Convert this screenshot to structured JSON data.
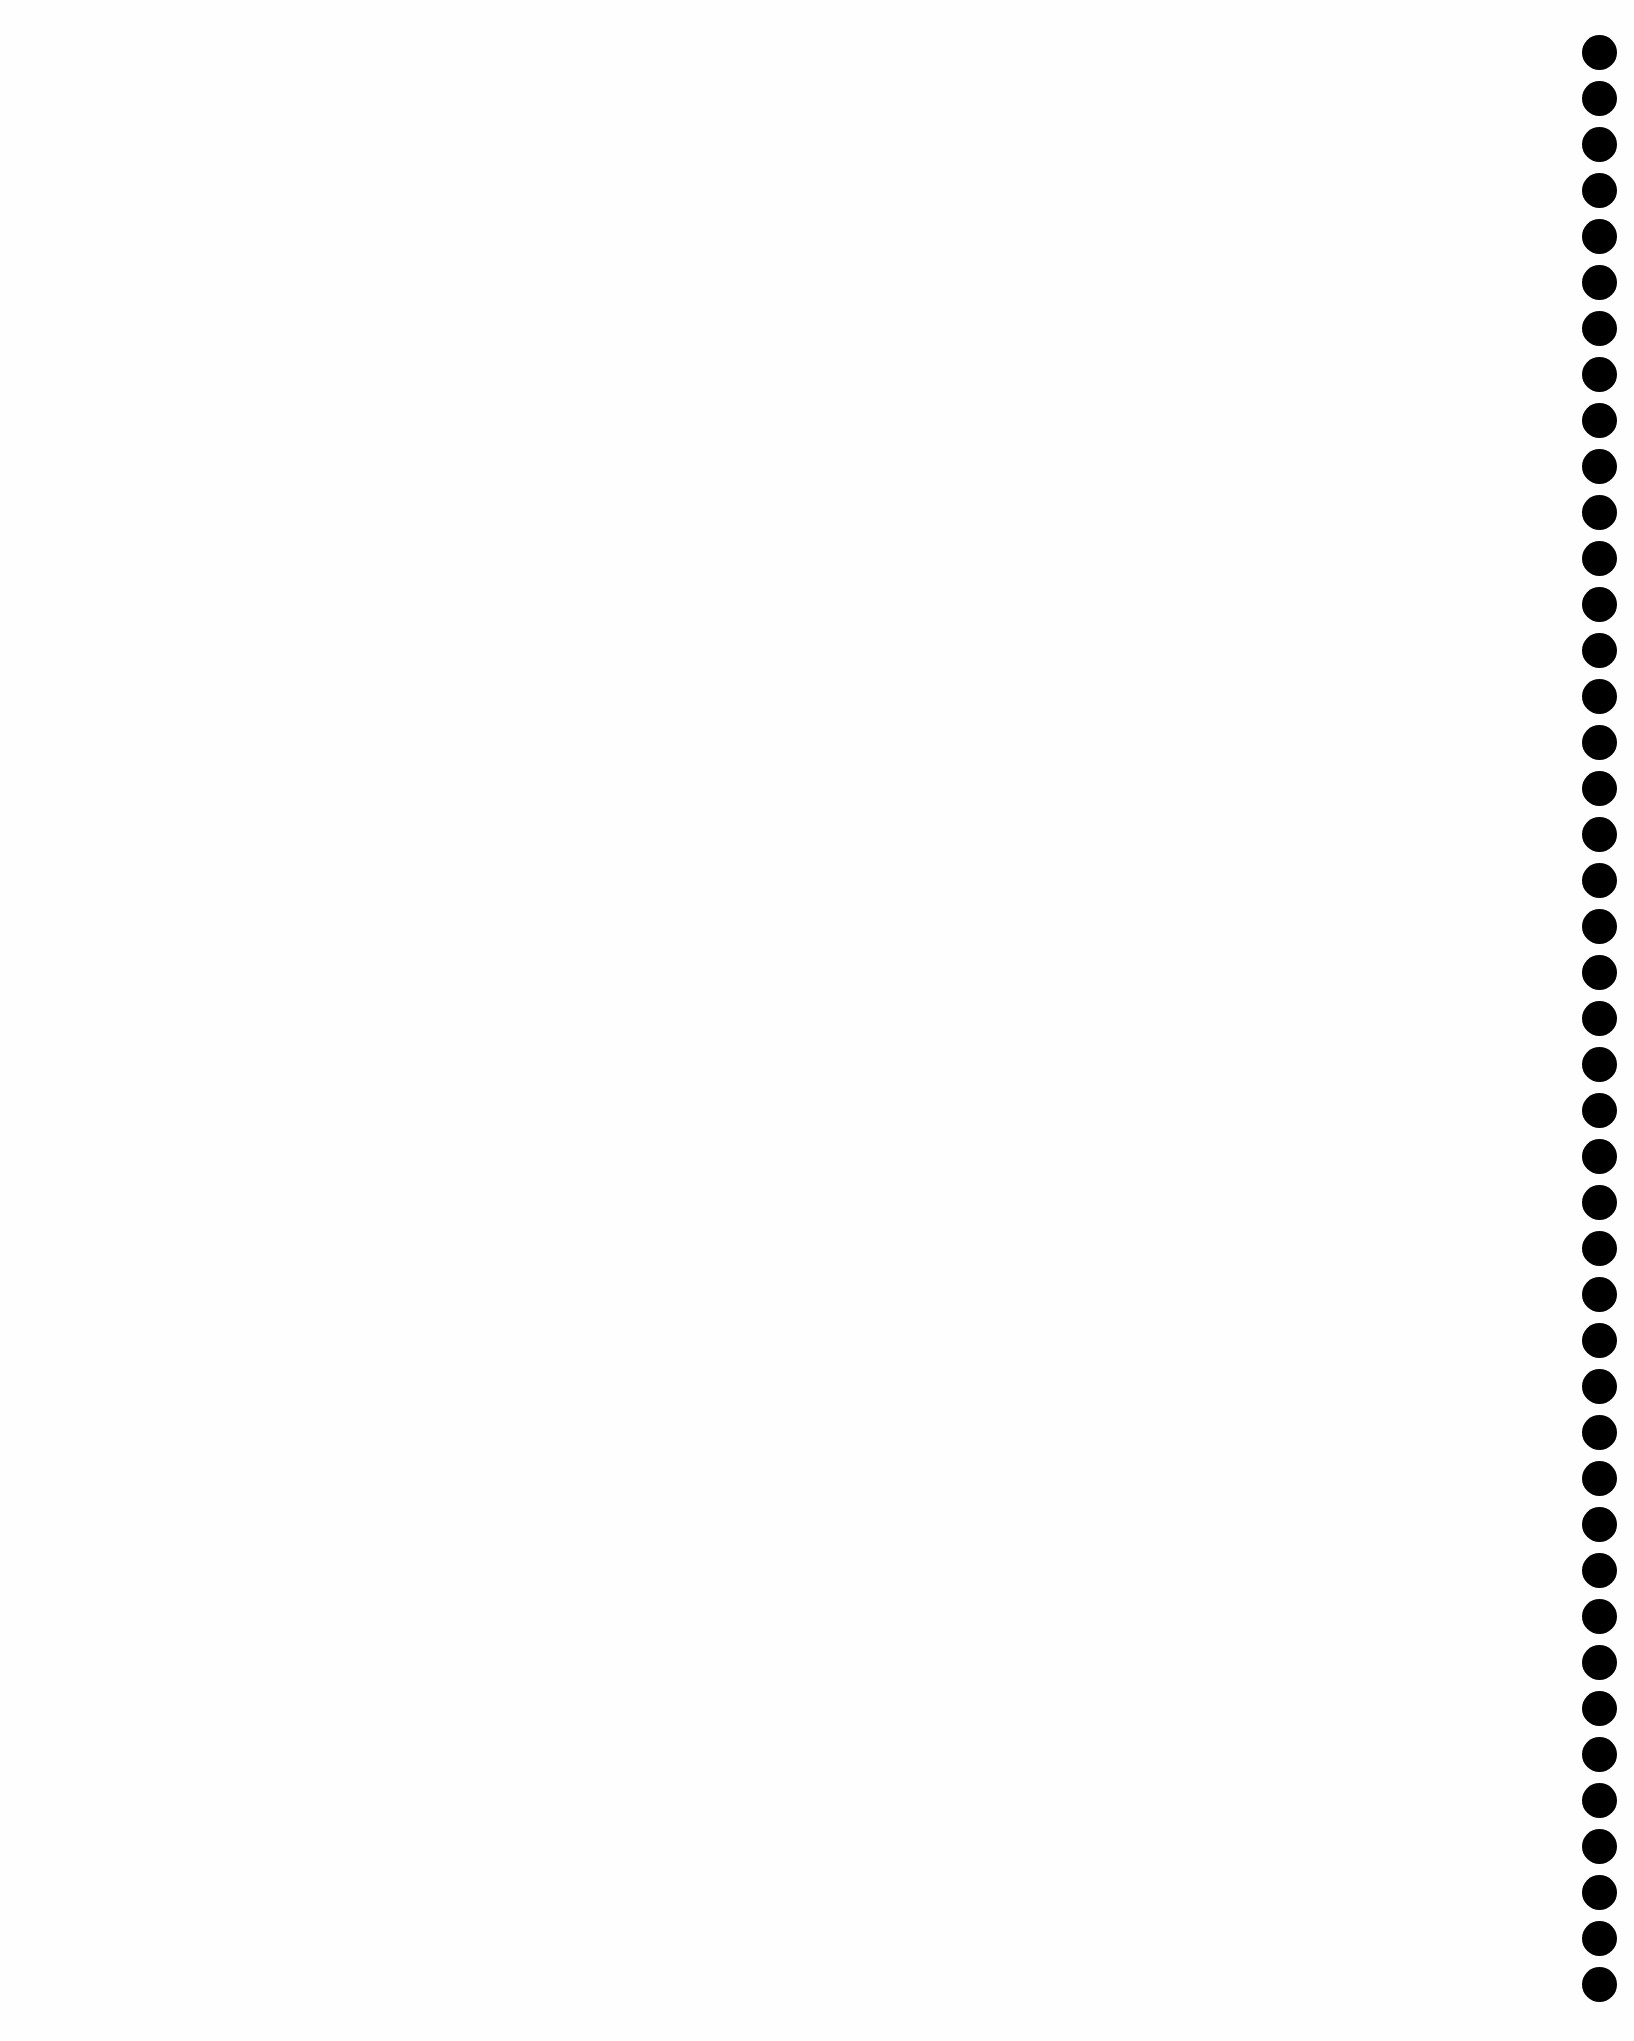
{
  "page": {
    "background_color": "#ffffff",
    "text_content": ""
  },
  "punch_holes": {
    "count": 43,
    "color": "#000000",
    "first_center_y": 52,
    "spacing_px": 46,
    "center_x": 1599,
    "diameter_px": 35
  }
}
